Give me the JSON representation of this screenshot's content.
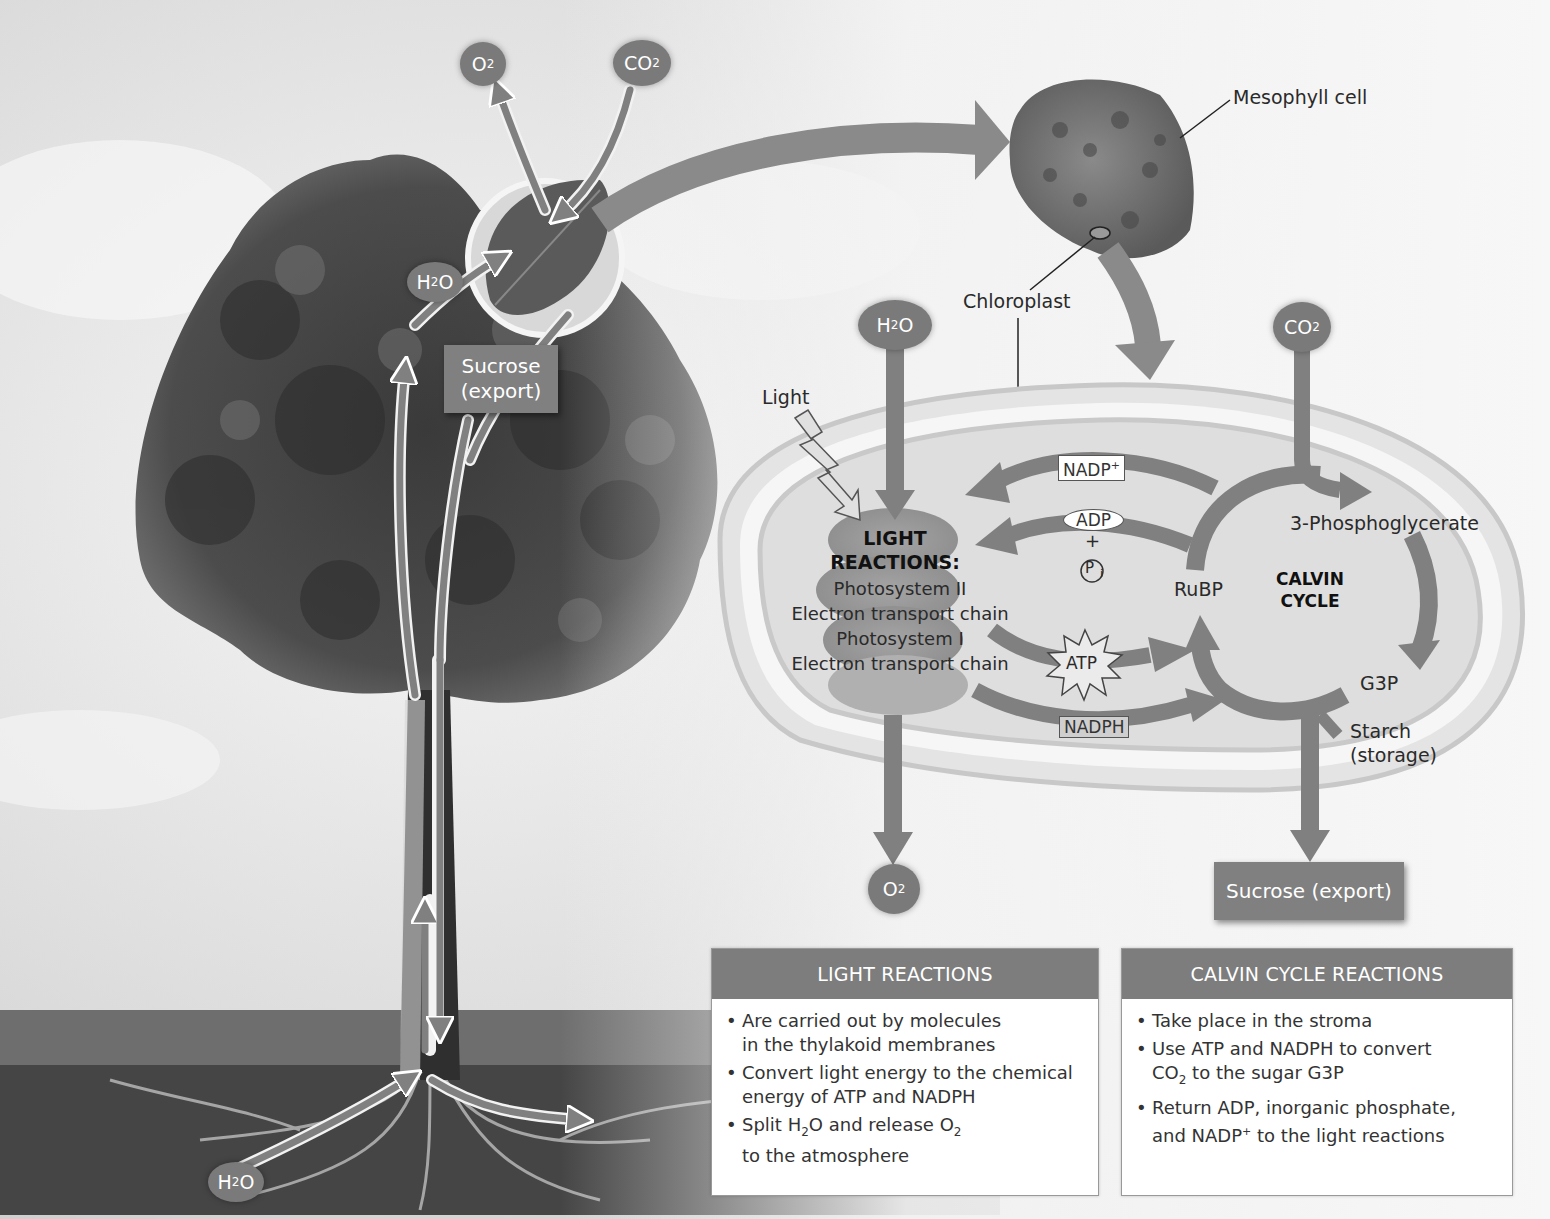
{
  "figure": {
    "colors": {
      "arrow": "#808080",
      "molecule_pill": "#7a7a7a",
      "panel_header": "#7d7d7d",
      "chloroplast_fill": "#dadada",
      "background": "#f2f2f2"
    }
  },
  "tree": {
    "o2_top": "O",
    "o2_top_sub": "2",
    "co2_top": "CO",
    "co2_top_sub": "2",
    "h2o_leaf_a": "H",
    "h2o_leaf_sub": "2",
    "h2o_leaf_b": "O",
    "sucrose_export_line1": "Sucrose",
    "sucrose_export_line2": "(export)",
    "h2o_root_a": "H",
    "h2o_root_sub": "2",
    "h2o_root_b": "O"
  },
  "cell": {
    "mesophyll_label": "Mesophyll cell",
    "chloroplast_label": "Chloroplast"
  },
  "chloroplast": {
    "light_label": "Light",
    "h2o_in_a": "H",
    "h2o_in_sub": "2",
    "h2o_in_b": "O",
    "co2_in_a": "CO",
    "co2_in_sub": "2",
    "o2_out_a": "O",
    "o2_out_sub": "2",
    "light_reactions_title_1": "LIGHT",
    "light_reactions_title_2": "REACTIONS:",
    "light_components": [
      "Photosystem II",
      "Electron transport chain",
      "Photosystem I",
      "Electron transport chain"
    ],
    "nadp_plus": "NADP",
    "nadp_plus_sup": "+",
    "adp": "ADP",
    "plus": "+",
    "pi": "P",
    "pi_sub": "i",
    "atp": "ATP",
    "nadph": "NADPH",
    "rubp": "RuBP",
    "calvin_title_1": "CALVIN",
    "calvin_title_2": "CYCLE",
    "pga": "3-Phosphoglycerate",
    "g3p": "G3P",
    "starch_1": "Starch",
    "starch_2": "(storage)",
    "sucrose_export": "Sucrose (export)"
  },
  "panels": {
    "light": {
      "header": "LIGHT REACTIONS",
      "bullets": [
        {
          "l1": "Are carried out by molecules",
          "l2": "in the thylakoid membranes"
        },
        {
          "l1": "Convert light energy to the chemical",
          "l2": "energy of ATP and NADPH"
        },
        {
          "l1a": "Split H",
          "l1sub1": "2",
          "l1b": "O and release O",
          "l1sub2": "2",
          "l2": "to the atmosphere"
        }
      ]
    },
    "calvin": {
      "header": "CALVIN CYCLE REACTIONS",
      "bullets": [
        {
          "l1": "Take place in the stroma"
        },
        {
          "l1": "Use ATP and NADPH to convert",
          "l2a": "CO",
          "l2sub": "2",
          "l2b": " to the sugar G3P"
        },
        {
          "l1": "Return ADP, inorganic phosphate,",
          "l2a": "and NADP",
          "l2sup": "+",
          "l2b": " to the light reactions"
        }
      ]
    }
  }
}
